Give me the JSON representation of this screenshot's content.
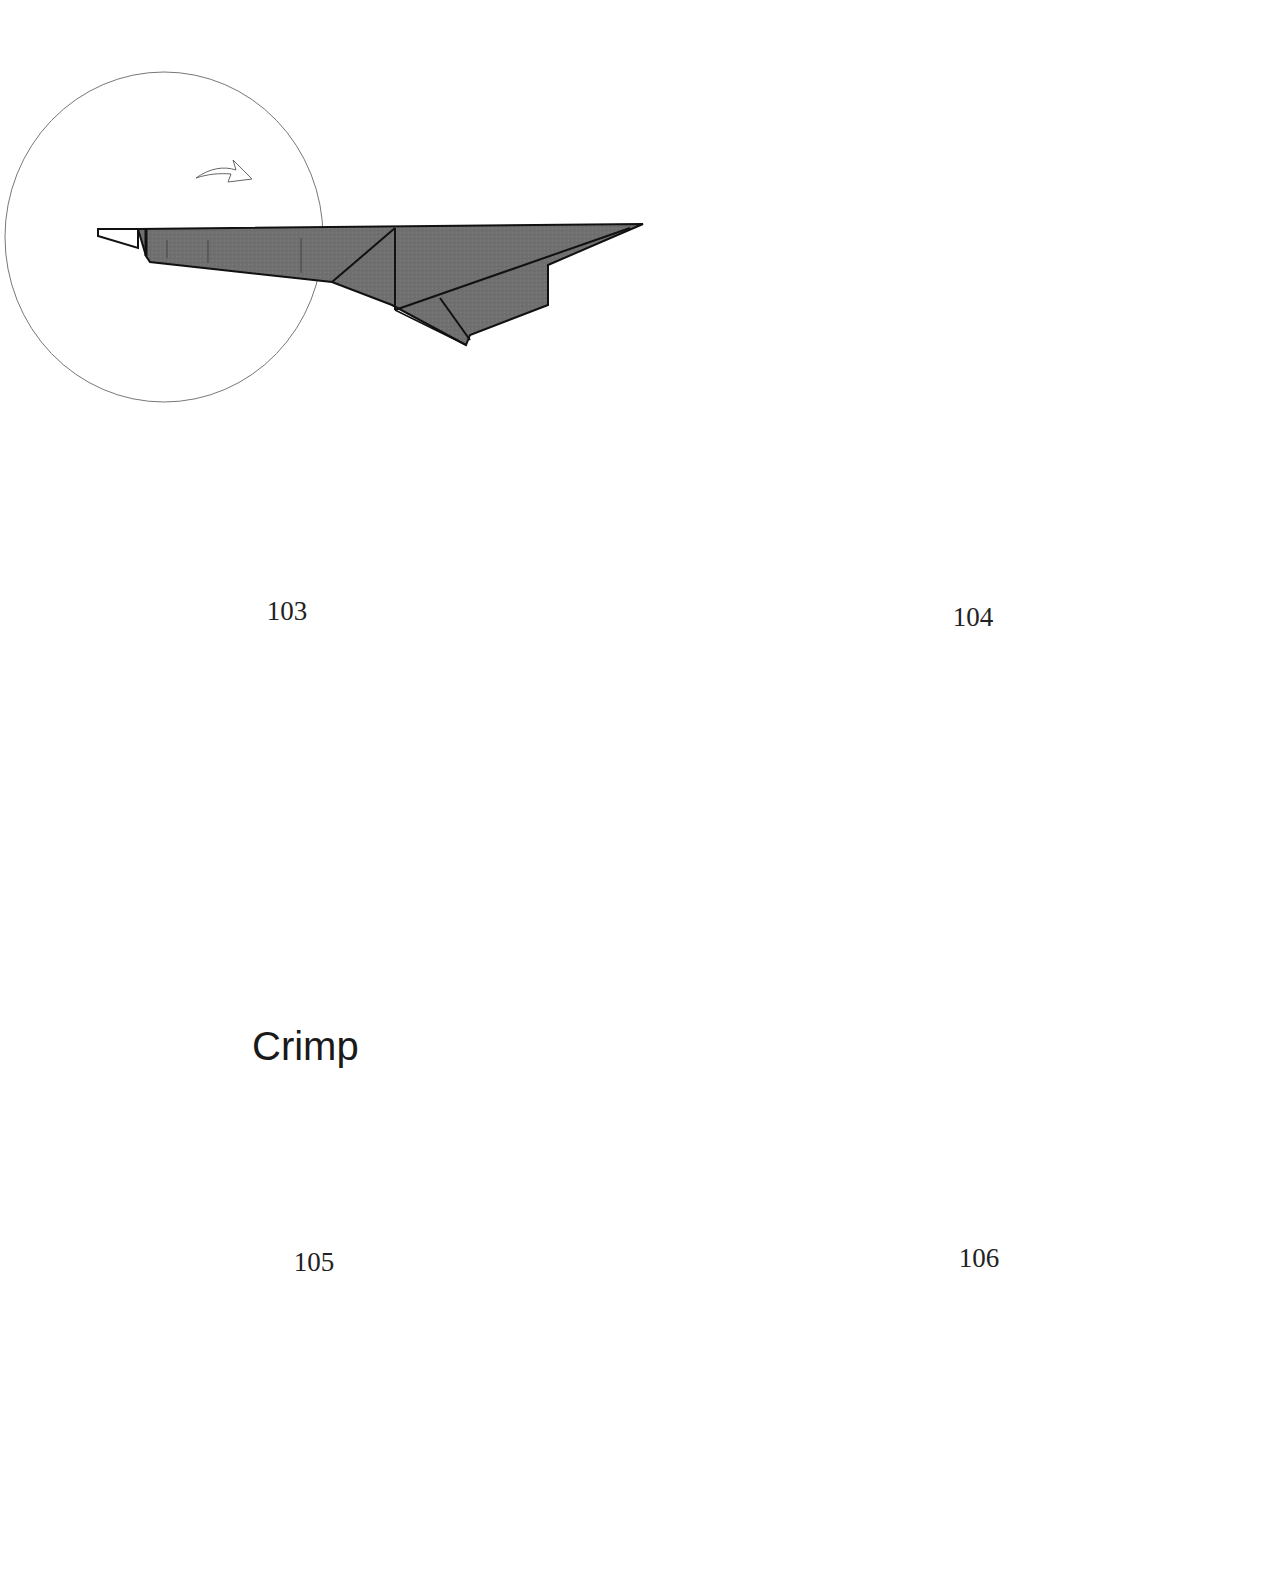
{
  "page": {
    "type": "origami instruction diagram page",
    "colors": {
      "paper_fill": "#6e6e6e",
      "paper_outline": "#111111",
      "white_flap": "#ffffff",
      "circle_stroke": "#555555",
      "background": "#ffffff"
    }
  },
  "steps": [
    {
      "number": "103",
      "symbols": [
        "turn-over-arrow"
      ],
      "label": ""
    },
    {
      "number": "104",
      "symbols": [
        "pull-arrow",
        "hand-pinch",
        "push-hollow-arrow"
      ],
      "label": ""
    },
    {
      "number": "105",
      "symbols": [
        "crimp-zigzag-arrows",
        "dashed-valley-line",
        "dotted-mountain-line"
      ],
      "label": "Crimp"
    },
    {
      "number": "106",
      "symbols": [
        "turn-over-arrow"
      ],
      "label": ""
    },
    {
      "number": "",
      "symbols": [
        "sink-push-arrow",
        "fold-arrow",
        "dotted-fold-line",
        "diagonal-fold-line"
      ],
      "label": ""
    },
    {
      "number": "",
      "symbols": [
        "sink-push-arrow",
        "curved-fold-arrow",
        "black-pleat-markers"
      ],
      "label": ""
    }
  ]
}
